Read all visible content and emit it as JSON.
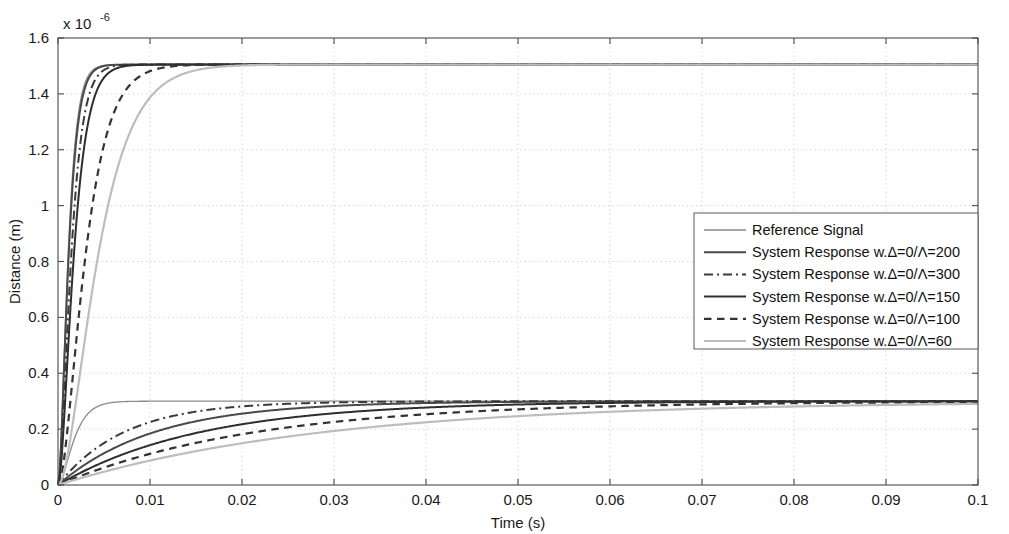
{
  "chart_data": {
    "type": "line",
    "title": "",
    "xlabel": "Time (s)",
    "ylabel": "Distance (m)",
    "y_exponent_label": "x 10",
    "y_exponent_value": "-6",
    "y_scale": 1e-06,
    "xlim": [
      0,
      0.1
    ],
    "ylim": [
      0,
      1.6
    ],
    "xticks": [
      0,
      0.01,
      0.02,
      0.03,
      0.04,
      0.05,
      0.06,
      0.07,
      0.08,
      0.09,
      0.1
    ],
    "xtick_labels": [
      "0",
      "0.01",
      "0.02",
      "0.03",
      "0.04",
      "0.05",
      "0.06",
      "0.07",
      "0.08",
      "0.09",
      "0.1"
    ],
    "yticks": [
      0,
      0.2,
      0.4,
      0.6,
      0.8,
      1.0,
      1.2,
      1.4,
      1.6
    ],
    "ytick_labels": [
      "0",
      "0.2",
      "0.4",
      "0.6",
      "0.8",
      "1",
      "1.2",
      "1.4",
      "1.6"
    ],
    "grid": true,
    "grid_style": "dotted",
    "legend_position": "center-right",
    "series": [
      {
        "name": "Reference Signal",
        "color": "#8a8a8a",
        "width": 1.3,
        "dash": "none",
        "upper_plateau": 1.505,
        "lower_plateau": 0.3,
        "upper_tau": 0.0012,
        "lower_tau": 0.0013,
        "upper_delay": 0.0,
        "lower_delay": 0.0,
        "upper_shape": 2.0,
        "lower_shape": 1.35
      },
      {
        "name": "System Response w.Δ=0/Λ=200",
        "color": "#4a4a4a",
        "width": 2.0,
        "dash": "none",
        "upper_plateau": 1.505,
        "lower_plateau": 0.3,
        "upper_tau": 0.00165,
        "lower_tau": 0.0105,
        "upper_delay": 0.0,
        "lower_delay": 0.0,
        "upper_shape": 2.6,
        "lower_shape": 1.0
      },
      {
        "name": "System Response w.Δ=0/Λ=300",
        "color": "#3a3a3a",
        "width": 2.0,
        "dash": "dashdot",
        "upper_plateau": 1.505,
        "lower_plateau": 0.3,
        "upper_tau": 0.00205,
        "lower_tau": 0.0072,
        "upper_delay": 0.0,
        "lower_delay": 0.0,
        "upper_shape": 2.6,
        "lower_shape": 1.0
      },
      {
        "name": "System Response w.Δ=0/Λ=150",
        "color": "#2e2e2e",
        "width": 2.0,
        "dash": "none",
        "upper_plateau": 1.505,
        "lower_plateau": 0.3,
        "upper_tau": 0.00245,
        "lower_tau": 0.0155,
        "upper_delay": 0.0,
        "lower_delay": 0.0,
        "upper_shape": 2.6,
        "lower_shape": 1.0
      },
      {
        "name": "System Response w.Δ=0/Λ=100",
        "color": "#333333",
        "width": 2.2,
        "dash": "dashed",
        "upper_plateau": 1.505,
        "lower_plateau": 0.3,
        "upper_tau": 0.00425,
        "lower_tau": 0.0215,
        "upper_delay": 0.0,
        "lower_delay": 0.0,
        "upper_shape": 2.6,
        "lower_shape": 1.0
      },
      {
        "name": "System Response w.Δ=0/Λ=60",
        "color": "#bdbdbd",
        "width": 2.2,
        "dash": "none",
        "upper_plateau": 1.505,
        "lower_plateau": 0.3,
        "upper_tau": 0.0062,
        "lower_tau": 0.029,
        "upper_delay": 0.0,
        "lower_delay": 0.0,
        "upper_shape": 2.6,
        "lower_shape": 1.0
      }
    ]
  },
  "axes": {
    "x_title": "Time (s)",
    "y_title": "Distance (m)",
    "exponent_prefix": "x 10",
    "exponent_power": "-6"
  },
  "legend": {
    "items": [
      {
        "label": "Reference Signal"
      },
      {
        "label": "System Response w.Δ=0/Λ=200"
      },
      {
        "label": "System Response w.Δ=0/Λ=300"
      },
      {
        "label": "System Response w.Δ=0/Λ=150"
      },
      {
        "label": "System Response w.Δ=0/Λ=100"
      },
      {
        "label": "System Response w.Δ=0/Λ=60"
      }
    ]
  }
}
